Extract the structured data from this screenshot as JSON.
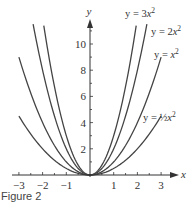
{
  "caption": "Figure 2",
  "chart_data": {
    "type": "line",
    "title": "",
    "xlabel": "x",
    "ylabel": "y",
    "xlim": [
      -3,
      3
    ],
    "ylim": [
      0,
      11.5
    ],
    "x_ticks": [
      -3,
      -2,
      -1,
      1,
      2,
      3
    ],
    "y_ticks": [
      2,
      4,
      6,
      8,
      10
    ],
    "grid": false,
    "series": [
      {
        "name": "y = 3x²",
        "label_parts": [
          "y = 3",
          "x",
          "2"
        ],
        "coef": 3,
        "x_range": [
          -1.95,
          1.95
        ]
      },
      {
        "name": "y = 2x²",
        "label_parts": [
          "y = 2",
          "x",
          "2"
        ],
        "coef": 2,
        "x_range": [
          -2.4,
          2.4
        ]
      },
      {
        "name": "y = x²",
        "label_parts": [
          "y = ",
          "x",
          "2"
        ],
        "coef": 1,
        "x_range": [
          -3,
          3
        ]
      },
      {
        "name": "y = ½x²",
        "label_parts": [
          "y = ½",
          "x",
          "2"
        ],
        "coef": 0.5,
        "x_range": [
          -3,
          3
        ]
      }
    ],
    "line_color": "#444444",
    "axis_color": "#333333"
  }
}
